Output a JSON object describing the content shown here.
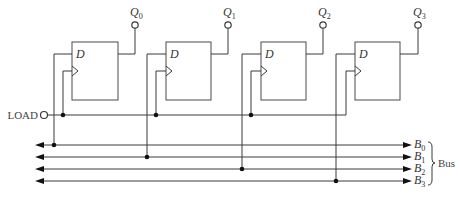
{
  "diagram": {
    "type": "4-bit parallel-load register connected to bus",
    "flipflops": [
      {
        "id": "ff0",
        "input_label": "D",
        "output_label": "Q",
        "output_sub": "0",
        "box_x": 72,
        "d_wire_x": 54,
        "clk_wire_x": 63,
        "q_x": 135,
        "bus_index": 0
      },
      {
        "id": "ff1",
        "input_label": "D",
        "output_label": "Q",
        "output_sub": "1",
        "box_x": 166,
        "d_wire_x": 147,
        "clk_wire_x": 156,
        "q_x": 228,
        "bus_index": 1
      },
      {
        "id": "ff2",
        "input_label": "D",
        "output_label": "Q",
        "output_sub": "2",
        "box_x": 261,
        "d_wire_x": 242,
        "clk_wire_x": 251,
        "q_x": 323,
        "bus_index": 2
      },
      {
        "id": "ff3",
        "input_label": "D",
        "output_label": "Q",
        "output_sub": "3",
        "box_x": 355,
        "d_wire_x": 336,
        "clk_wire_x": 346,
        "q_x": 418,
        "bus_index": 3
      }
    ],
    "load": {
      "label": "LOAD"
    },
    "bus": {
      "label": "Bus",
      "lines": [
        {
          "label": "B",
          "sub": "0",
          "y": 145
        },
        {
          "label": "B",
          "sub": "1",
          "y": 157
        },
        {
          "label": "B",
          "sub": "2",
          "y": 169
        },
        {
          "label": "B",
          "sub": "3",
          "y": 181
        }
      ]
    },
    "colors": {
      "line": "#3a3a3a",
      "dot": "#111111",
      "text": "#333333",
      "background": "#ffffff"
    }
  }
}
